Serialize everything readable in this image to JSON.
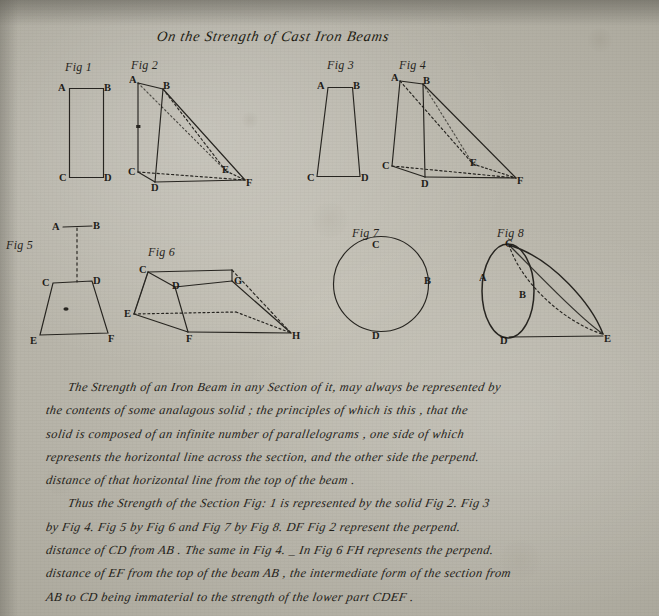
{
  "document": {
    "title": "On the Strength of Cast Iron Beams",
    "medium": "handwritten manuscript page, ink on laid paper",
    "ink_color": "#15130f",
    "paper_color": "#b6b3a8"
  },
  "figures": [
    {
      "id": "fig1",
      "caption": "Fig 1",
      "shape": "rectangle",
      "vertex_labels": [
        "A",
        "B",
        "C",
        "D"
      ]
    },
    {
      "id": "fig2",
      "caption": "Fig 2",
      "shape": "oblique wedge solid",
      "vertex_labels": [
        "A",
        "B",
        "C",
        "D",
        "E",
        "F"
      ]
    },
    {
      "id": "fig3",
      "caption": "Fig 3",
      "shape": "trapezoid",
      "vertex_labels": [
        "A",
        "B",
        "C",
        "D"
      ]
    },
    {
      "id": "fig4",
      "caption": "Fig 4",
      "shape": "oblique wedge solid",
      "vertex_labels": [
        "A",
        "B",
        "C",
        "D",
        "E",
        "F"
      ]
    },
    {
      "id": "fig5",
      "caption": "Fig 5",
      "shape": "trapezoid below a detached line AB",
      "vertex_labels": [
        "A",
        "B",
        "C",
        "D",
        "E",
        "F"
      ]
    },
    {
      "id": "fig6",
      "caption": "Fig 6",
      "shape": "trapezoidal prism solid",
      "vertex_labels": [
        "C",
        "D",
        "G",
        "E",
        "F",
        "H"
      ]
    },
    {
      "id": "fig7",
      "caption": "Fig 7",
      "shape": "circle",
      "vertex_labels": [
        "C",
        "B",
        "D"
      ]
    },
    {
      "id": "fig8",
      "caption": "Fig 8",
      "shape": "oblique cone on an elliptical base",
      "vertex_labels": [
        "A",
        "B",
        "C",
        "D",
        "E"
      ]
    }
  ],
  "body": {
    "lines": [
      "The Strength of an Iron Beam in any Section of it, may always be represented by",
      "the contents of some analagous solid ; the principles of which is this , that the",
      "solid is composed of an infinite number of parallelograms , one side of which",
      "represents the horizontal line across the section, and the other side the perpend.",
      "distance of that horizontal line from the top of the beam .",
      "Thus the Strength of the Section Fig: 1 is represented by the solid Fig 2.        Fig 3",
      "by Fig 4.    Fig 5 by Fig 6 and Fig 7 by Fig 8.              DF Fig 2 represent the perpend.",
      "distance of CD from AB . The same in Fig 4. _     In Fig 6   FH represents the perpend.",
      "distance of EF from the top of the beam AB , the intermediate form of the section from",
      "AB to CD  being immaterial to the strength of the lower part CDEF ."
    ],
    "line4_struck_word": "the",
    "line4_insertion": "a"
  }
}
